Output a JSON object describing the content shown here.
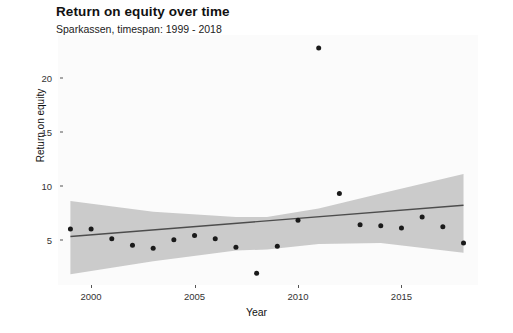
{
  "chart_data": {
    "type": "scatter",
    "title": "Return on equity over time",
    "subtitle": "Sparkassen, timespan: 1999 - 2018",
    "xlabel": "Year",
    "ylabel": "Return on equity",
    "xlim": [
      1998.4,
      2018.7
    ],
    "ylim": [
      0.8,
      24.0
    ],
    "grid": false,
    "legend": null,
    "xticks": [
      2000,
      2005,
      2010,
      2015
    ],
    "yticks": [
      5,
      10,
      15,
      20
    ],
    "x": [
      1999,
      2000,
      2001,
      2002,
      2003,
      2004,
      2005,
      2006,
      2007,
      2008,
      2009,
      2010,
      2011,
      2012,
      2013,
      2014,
      2015,
      2016,
      2017,
      2018
    ],
    "values": [
      6.0,
      6.0,
      5.1,
      4.5,
      4.2,
      5.0,
      5.4,
      5.1,
      4.3,
      1.9,
      4.4,
      6.8,
      22.8,
      9.3,
      6.4,
      6.3,
      6.1,
      7.1,
      6.2,
      4.7
    ],
    "series": [
      {
        "name": "Return on equity",
        "type": "points",
        "values": [
          6.0,
          6.0,
          5.1,
          4.5,
          4.2,
          5.0,
          5.4,
          5.1,
          4.3,
          1.9,
          4.4,
          6.8,
          22.8,
          9.3,
          6.4,
          6.3,
          6.1,
          7.1,
          6.2,
          4.7
        ],
        "color": "#1a1a1a"
      },
      {
        "name": "Linear trend",
        "type": "line",
        "x": [
          1999,
          2018
        ],
        "values": [
          5.3,
          8.2
        ],
        "color": "#4d4d4d"
      },
      {
        "name": "Confidence band",
        "type": "ribbon",
        "x": [
          1999,
          2003,
          2007,
          2008.5,
          2011,
          2014,
          2018
        ],
        "upper": [
          8.6,
          7.6,
          7.1,
          7.1,
          7.9,
          9.3,
          11.1
        ],
        "lower": [
          1.8,
          3.0,
          4.0,
          4.1,
          4.6,
          4.7,
          3.8
        ],
        "color": "#bfbfbf"
      }
    ],
    "point_color": "#1a1a1a",
    "line_color": "#4d4d4d",
    "ribbon_color": "#bfbfbf",
    "panel_background": "#fbfbfb"
  }
}
